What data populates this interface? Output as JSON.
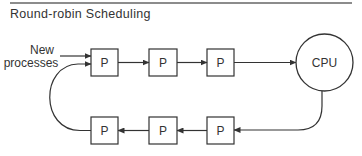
{
  "figure": {
    "title": "Round-robin Scheduling",
    "new_label_line1": "New",
    "new_label_line2": "processes",
    "process_label": "P",
    "cpu_label": "CPU",
    "colors": {
      "stroke": "#333333",
      "rule": "#8c8c8c",
      "background": "#ffffff"
    }
  },
  "nodes": {
    "top_queue": [
      {
        "label": "P"
      },
      {
        "label": "P"
      },
      {
        "label": "P"
      }
    ],
    "cpu": {
      "label": "CPU"
    },
    "bottom_queue": [
      {
        "label": "P"
      },
      {
        "label": "P"
      },
      {
        "label": "P"
      }
    ]
  }
}
